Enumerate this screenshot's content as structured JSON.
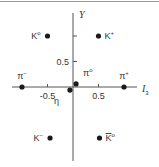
{
  "diagram": {
    "x_axis": {
      "label": "I",
      "label_sub": "3",
      "ticks": [
        -0.5,
        0.5
      ],
      "tick_labels": [
        "-0.5",
        "0.5"
      ],
      "range": [
        -1.1,
        1.2
      ]
    },
    "y_axis": {
      "label": "Y",
      "ticks": [
        0.5,
        1
      ],
      "tick_labels": [
        "0.5"
      ],
      "range": [
        -1.4,
        1.45
      ]
    },
    "particles": [
      {
        "name": "K0",
        "base": "K",
        "sup": "o",
        "bar": false,
        "i3": -0.5,
        "y": 1,
        "label_side": "left"
      },
      {
        "name": "K+",
        "base": "K",
        "sup": "+",
        "bar": false,
        "i3": 0.5,
        "y": 1,
        "label_side": "right"
      },
      {
        "name": "pi-",
        "base": "π",
        "sup": "−",
        "bar": false,
        "i3": -1,
        "y": 0,
        "label_side": "above"
      },
      {
        "name": "pi0",
        "base": "π",
        "sup": "o",
        "bar": false,
        "i3": 0.06,
        "y": 0.06,
        "label_side": "above-right"
      },
      {
        "name": "eta",
        "base": "η",
        "sup": "",
        "bar": false,
        "i3": -0.06,
        "y": -0.06,
        "label_side": "below-left"
      },
      {
        "name": "pi+",
        "base": "π",
        "sup": "+",
        "bar": false,
        "i3": 1,
        "y": 0,
        "label_side": "above"
      },
      {
        "name": "K-",
        "base": "K",
        "sup": "−",
        "bar": false,
        "i3": -0.45,
        "y": -1,
        "label_side": "left"
      },
      {
        "name": "K0bar",
        "base": "K",
        "sup": "o",
        "bar": true,
        "i3": 0.52,
        "y": -1,
        "label_side": "right"
      }
    ]
  }
}
